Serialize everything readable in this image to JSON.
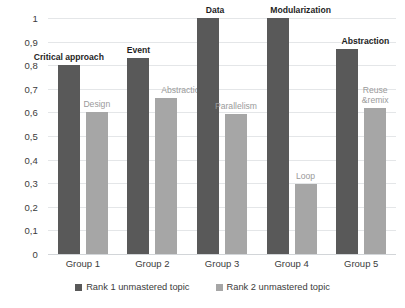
{
  "chart_data": {
    "type": "bar",
    "title": "",
    "xlabel": "",
    "ylabel": "",
    "ylim": [
      0,
      1
    ],
    "grid": true,
    "legend_position": "bottom",
    "categories": [
      "Group 1",
      "Group 2",
      "Group 3",
      "Group 4",
      "Group 5"
    ],
    "y_ticks": [
      "0",
      "0,1",
      "0,2",
      "0,3",
      "0,4",
      "0,5",
      "0,6",
      "0,7",
      "0,8",
      "0,9",
      "1"
    ],
    "y_tick_values": [
      0,
      0.1,
      0.2,
      0.3,
      0.4,
      0.5,
      0.6,
      0.7,
      0.8,
      0.9,
      1
    ],
    "series": [
      {
        "name": "Rank 1 unmastered topic",
        "color": "#595959",
        "values": [
          0.8,
          0.83,
          1.0,
          1.0,
          0.87
        ],
        "point_labels": [
          "Critical approach",
          "Event",
          "Data",
          "Modularization",
          "Abstraction"
        ]
      },
      {
        "name": "Rank 2 unmastered topic",
        "color": "#a6a6a6",
        "values": [
          0.6,
          0.66,
          0.595,
          0.295,
          0.62
        ],
        "point_labels": [
          "Design",
          "Abstraction",
          "Parallelism",
          "Loop",
          "Reuse &remix"
        ]
      }
    ]
  },
  "legend": {
    "entries": [
      {
        "label": "Rank 1 unmastered topic",
        "color": "#595959"
      },
      {
        "label": "Rank 2 unmastered topic",
        "color": "#a6a6a6"
      }
    ]
  }
}
